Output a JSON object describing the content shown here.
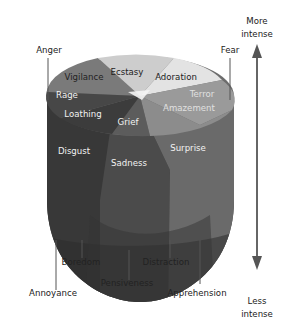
{
  "diagram": {
    "axis": {
      "top_label_line1": "More",
      "top_label_line2": "intense",
      "bottom_label_line1": "Less",
      "bottom_label_line2": "intense"
    },
    "top_labels": {
      "anger": "Anger",
      "fear": "Fear"
    },
    "intense_emotions": {
      "ecstasy": "Ecstasy",
      "adoration": "Adoration",
      "terror": "Terror",
      "amazement": "Amazement",
      "grief": "Grief",
      "loathing": "Loathing",
      "rage": "Rage",
      "vigilance": "Vigilance"
    },
    "basic_emotions": {
      "disgust": "Disgust",
      "sadness": "Sadness",
      "surprise": "Surprise"
    },
    "mild_emotions": {
      "annoyance": "Annoyance",
      "boredom": "Boredom",
      "pensiveness": "Pensiveness",
      "distraction": "Distraction",
      "apprehension": "Apprehension"
    },
    "colors": {
      "ecstasy": "#cfcfcf",
      "adoration": "#e2e2e2",
      "terror": "#9a9a9a",
      "grief": "#5e5e5e",
      "loathing": "#3c3c3c",
      "rage": "#4a4a4a",
      "vigilance": "#7a7a7a",
      "disgust": "#3a3a3a",
      "sadness": "#4e4e4e",
      "surprise": "#6e6e6e",
      "axis": "#555555"
    }
  }
}
